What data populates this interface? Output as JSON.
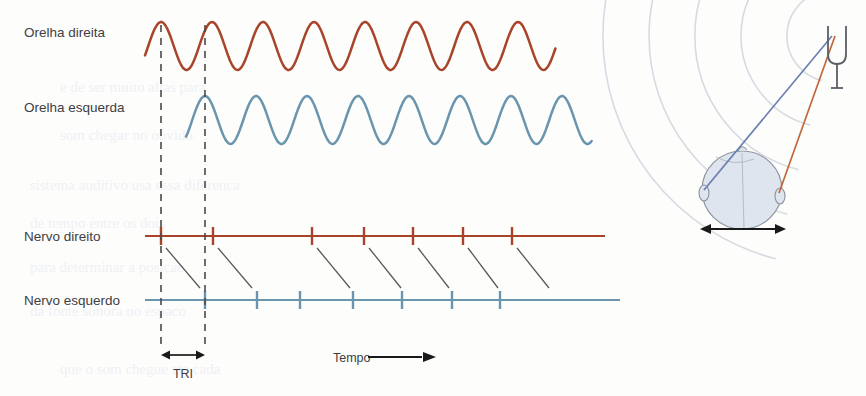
{
  "figure": {
    "background": "#fdfdfc",
    "colors": {
      "right_red": "#A8442A",
      "left_blue": "#6B95AE",
      "text": "#3d4043",
      "dashed": "#4a4a4a",
      "connector": "#5a5a5a",
      "head_fill": "#dde3ec",
      "head_stroke": "#8a8f99",
      "wave_arc": "#c9cfd8",
      "fork_stroke": "#5a5f66",
      "ghost_text": "#eef0f4"
    }
  },
  "labels": {
    "right_ear": "Orelha direita",
    "left_ear": "Orelha esquerda",
    "right_nerve": "Nervo direito",
    "left_nerve": "Nervo esquerdo",
    "time": "Tempo",
    "itd": "TRI"
  },
  "chart_data": {
    "type": "line",
    "xlabel": "Tempo",
    "ylabel": "",
    "traces": [
      {
        "name": "Orelha direita",
        "kind": "sine",
        "color": "#A8442A",
        "x_start": 145,
        "x_end": 556,
        "baseline_y": 46,
        "amplitude": 24,
        "wavelength": 51,
        "phase_offset": 0,
        "peaks": 8
      },
      {
        "name": "Orelha esquerda",
        "kind": "sine",
        "color": "#6B95AE",
        "x_start": 186,
        "x_end": 592,
        "baseline_y": 120,
        "amplitude": 24,
        "wavelength": 51,
        "phase_offset": 41,
        "peaks": 8
      },
      {
        "name": "Nervo direito",
        "kind": "spike-train",
        "color": "#A8442A",
        "axis_y": 236,
        "x_start": 145,
        "x_end": 605,
        "spikes": [
          161,
          213,
          312,
          364,
          413,
          463,
          512
        ],
        "spike_height": 18
      },
      {
        "name": "Nervo esquerdo",
        "kind": "spike-train",
        "color": "#6B95AE",
        "axis_y": 300,
        "x_start": 145,
        "x_end": 620,
        "spikes": [
          205,
          257,
          300,
          353,
          402,
          452,
          500
        ],
        "spike_height": 18
      }
    ],
    "connectors": [
      {
        "x1": 166,
        "y1": 248,
        "x2": 200,
        "y2": 288
      },
      {
        "x1": 218,
        "y1": 248,
        "x2": 252,
        "y2": 288
      },
      {
        "x1": 317,
        "y1": 248,
        "x2": 350,
        "y2": 288
      },
      {
        "x1": 369,
        "y1": 248,
        "x2": 401,
        "y2": 288
      },
      {
        "x1": 418,
        "y1": 248,
        "x2": 449,
        "y2": 288
      },
      {
        "x1": 468,
        "y1": 248,
        "x2": 498,
        "y2": 288
      },
      {
        "x1": 517,
        "y1": 248,
        "x2": 549,
        "y2": 288
      }
    ],
    "markers": {
      "dashed_line_1_x": 161,
      "dashed_line_2_x": 205,
      "dashed_top_y": 25,
      "dashed_bottom_y": 350,
      "itd_arrow_y": 355,
      "time_arrow": {
        "x1": 368,
        "x2": 430,
        "y": 357
      }
    }
  },
  "scene": {
    "description": "Cabeca vista de cima com diapasao emitindo ondas sonoras",
    "head": {
      "cx": 742,
      "cy": 188,
      "rx": 40,
      "ry": 40
    },
    "tuning_fork": {
      "x": 837,
      "y": 30
    },
    "sound_arcs": 5,
    "path_left_color": "#6B7FB0",
    "path_right_color": "#C2673A",
    "head_arrow": {
      "x1": 700,
      "x2": 782,
      "y": 229
    }
  },
  "ghost_lines": [
    "e de ser muito altas para",
    "som chegar no ouvido",
    "sistema auditivo usa essa diferenca",
    "de tempo entre os dois",
    "para determinar a posicao",
    "da fonte sonora no espaco",
    "que o som chegue ate cada"
  ]
}
